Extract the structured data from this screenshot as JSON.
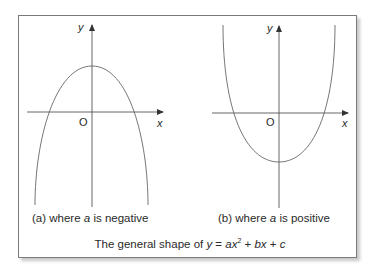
{
  "caption": {
    "prefix": "The general shape of ",
    "y": "y",
    "eq": " = ",
    "a": "ax",
    "sq": "2",
    "rest1": " + ",
    "b": "bx",
    "rest2": " + ",
    "c": "c"
  },
  "panels": [
    {
      "id": "a",
      "label_prefix": "(a) where ",
      "label_var": "a",
      "label_suffix": " is negative",
      "x_axis_label": "x",
      "y_axis_label": "y",
      "origin_label": "O"
    },
    {
      "id": "b",
      "label_prefix": "(b) where ",
      "label_var": "a",
      "label_suffix": " is positive",
      "x_axis_label": "x",
      "y_axis_label": "y",
      "origin_label": "O"
    }
  ],
  "colors": {
    "line": "#555555",
    "frame": "#7a7a7a",
    "text": "#2a2a2a"
  }
}
